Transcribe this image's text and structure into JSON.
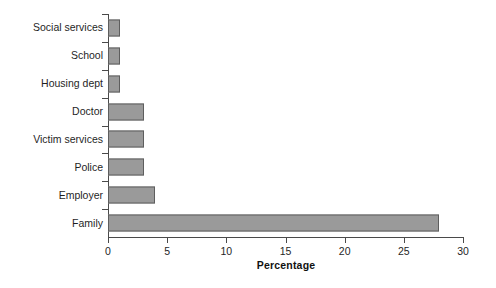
{
  "chart_data": {
    "type": "bar",
    "orientation": "horizontal",
    "title": "",
    "xlabel": "Percentage",
    "ylabel": "",
    "xlim": [
      0,
      30
    ],
    "xticks": [
      0,
      5,
      10,
      15,
      20,
      25,
      30
    ],
    "xtick_labels": [
      "0",
      "5",
      "10",
      "15",
      "20",
      "25",
      "30"
    ],
    "grid": false,
    "legend": false,
    "bar_color": "#9a9a9a",
    "bar_edge_color": "#5e5e5e",
    "axis_color": "#4a4a4a",
    "categories": [
      "Social services",
      "School",
      "Housing dept",
      "Doctor",
      "Victim services",
      "Police",
      "Employer",
      "Family"
    ],
    "values": [
      1,
      1,
      1,
      3,
      3,
      3,
      4,
      28
    ],
    "bars": [
      {
        "category": "Social services",
        "value": 1
      },
      {
        "category": "School",
        "value": 1
      },
      {
        "category": "Housing dept",
        "value": 1
      },
      {
        "category": "Doctor",
        "value": 3
      },
      {
        "category": "Victim services",
        "value": 3
      },
      {
        "category": "Police",
        "value": 3
      },
      {
        "category": "Employer",
        "value": 4
      },
      {
        "category": "Family",
        "value": 28
      }
    ]
  }
}
